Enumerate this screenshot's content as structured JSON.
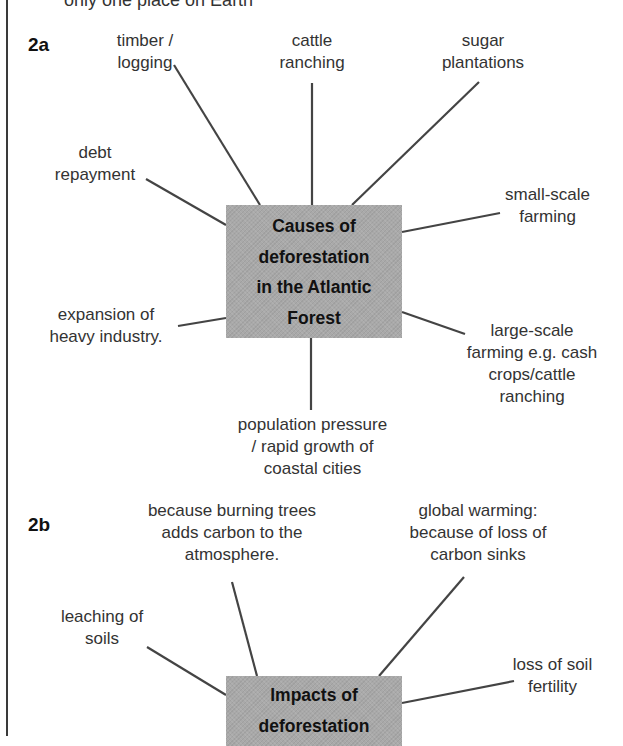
{
  "header": {
    "cut_off_text": "only one place on Earth"
  },
  "causes": {
    "label": "2a",
    "center": [
      "Causes of",
      "deforestation",
      "in the Atlantic",
      "Forest"
    ],
    "items": [
      {
        "lines": [
          "timber /",
          "logging"
        ]
      },
      {
        "lines": [
          "cattle",
          "ranching"
        ]
      },
      {
        "lines": [
          "sugar",
          "plantations"
        ]
      },
      {
        "lines": [
          "debt",
          "repayment"
        ]
      },
      {
        "lines": [
          "small-scale",
          "farming"
        ]
      },
      {
        "lines": [
          "expansion of",
          "heavy industry."
        ]
      },
      {
        "lines": [
          "large-scale",
          "farming e.g. cash",
          "crops/cattle",
          "ranching"
        ]
      },
      {
        "lines": [
          "population pressure",
          "/ rapid growth of",
          "coastal cities"
        ]
      }
    ]
  },
  "impacts": {
    "label": "2b",
    "center": [
      "Impacts of",
      "deforestation"
    ],
    "items": [
      {
        "lines": [
          "because burning trees",
          "adds carbon to the",
          "atmosphere."
        ]
      },
      {
        "lines": [
          "global warming:",
          "because of loss of",
          "carbon sinks"
        ]
      },
      {
        "lines": [
          "leaching of",
          "soils"
        ]
      },
      {
        "lines": [
          "loss of soil",
          "fertility"
        ]
      }
    ]
  },
  "colors": {
    "box_fill": "#a9a9a9",
    "line": "#444444",
    "text": "#333333",
    "border": "#3a3a3a"
  }
}
